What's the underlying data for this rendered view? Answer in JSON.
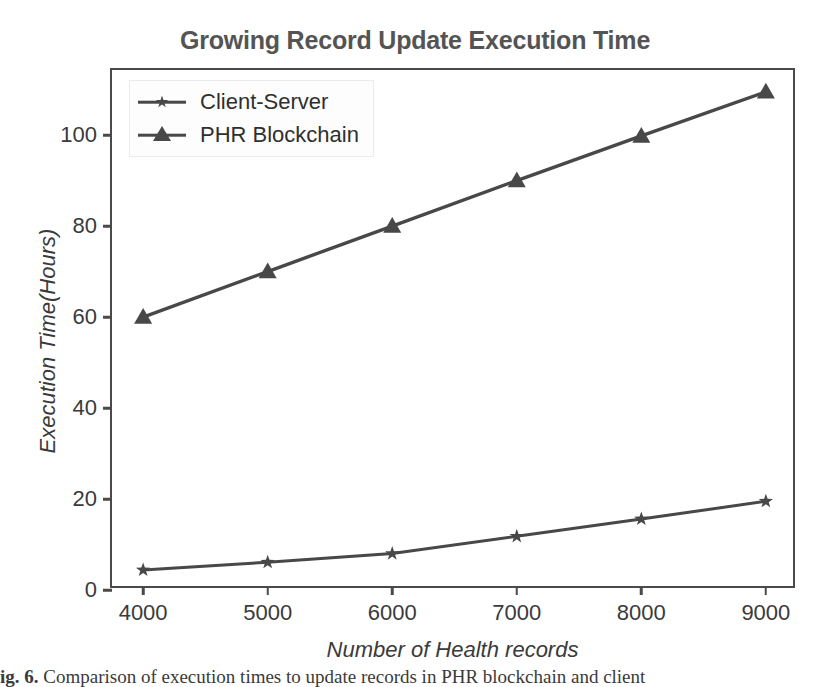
{
  "chart_data": {
    "type": "line",
    "title": "Growing Record Update Execution Time",
    "xlabel": "Number of Health records",
    "ylabel": "Execution Time(Hours)",
    "x": [
      4000,
      5000,
      6000,
      7000,
      8000,
      9000
    ],
    "xticklabels": [
      "4000",
      "5000",
      "6000",
      "7000",
      "8000",
      "9000"
    ],
    "yticks": [
      0,
      20,
      40,
      60,
      80,
      100
    ],
    "yticklabels": [
      "0",
      "20",
      "40",
      "60",
      "80",
      "100"
    ],
    "xlim": [
      3750,
      9250
    ],
    "ylim": [
      0,
      114.3
    ],
    "grid": false,
    "legend_position": "upper left",
    "series": [
      {
        "name": "Client-Server",
        "marker": "star",
        "color": "#484848",
        "values": [
          4.4,
          6.1,
          8.0,
          11.8,
          15.6,
          19.5
        ]
      },
      {
        "name": "PHR Blockchain",
        "marker": "triangle",
        "color": "#484848",
        "values": [
          60.0,
          70.0,
          80.0,
          90.0,
          99.8,
          109.5
        ]
      }
    ]
  },
  "style": {
    "title_color": "#545454",
    "axis_color": "#4a4a4a",
    "tick_label_color": "#3a3a3a",
    "line_color": "#484848",
    "background": "#ffffff"
  },
  "caption": {
    "prefix": "ig. 6.",
    "text": " Comparison of execution times to update records in PHR blockchain and client"
  }
}
